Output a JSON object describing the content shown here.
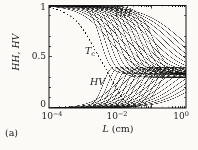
{
  "panel_label": "(a)",
  "axes": {
    "y": {
      "label": "HH, HV",
      "ticks": [
        "1",
        "0.5",
        "0"
      ]
    },
    "x": {
      "label_var": "L",
      "label_unit": " (cm)",
      "ticks": [
        {
          "base": "10",
          "exp": "−4"
        },
        {
          "base": "10",
          "exp": "−2"
        },
        {
          "base": "10",
          "exp": "0"
        }
      ]
    }
  },
  "annotations": {
    "hh": "HH",
    "hv": "HV",
    "tc_main": "T",
    "tc_sub": "c"
  },
  "chart_data": {
    "type": "line",
    "title": "",
    "xlabel": "L (cm)",
    "ylabel": "HH, HV",
    "x_axis": {
      "scale": "log10",
      "range_log10": [
        -4,
        0
      ],
      "tick_labels": [
        "10^-4",
        "10^-2",
        "10^0"
      ],
      "minor_ticks": true
    },
    "y_axis": {
      "range": [
        0,
        1
      ],
      "major_ticks": [
        0,
        0.5,
        1
      ],
      "minor_tick_step": 0.1
    },
    "frame_px": {
      "left": 49,
      "top": 5.5,
      "right": 186,
      "bottom": 108
    },
    "ink": "#131313",
    "curve_alpha": 0.8,
    "families": {
      "hh": {
        "label": "HH",
        "start_value": 1,
        "asymptote": 0.33,
        "model": "HH(x) = A + (1-A)/(1+exp((x-t)/w)), x = log10(L in cm)",
        "subfamilies": [
          {
            "count": 13,
            "t_range": [
              -2.5,
              -0.95
            ],
            "w_range": [
              0.15,
              0.22
            ]
          },
          {
            "count": 13,
            "t_range": [
              -2.25,
              -0.12
            ],
            "w_range": [
              0.42,
              0.58
            ]
          }
        ]
      },
      "hv": {
        "label": "HV",
        "start_value": 0,
        "settle_value": 0.3,
        "peak_param": 0.52,
        "release": 3.0,
        "model": "HV(x) = P*s(u) - (P-E)*s(u-g), u = (x-s0)/v, s(z)=1/(1+exp(-z))",
        "subfamilies": [
          {
            "count": 13,
            "s_range": [
              -2.4,
              -0.75
            ],
            "v_range": [
              0.14,
              0.2
            ]
          },
          {
            "count": 13,
            "s_range": [
              -2.0,
              0.45
            ],
            "v_range": [
              0.38,
              0.55
            ]
          }
        ]
      }
    },
    "tc_curve": {
      "label": "T_c",
      "style": "dashed",
      "points": [
        [
          -4,
          0.985
        ],
        [
          -3.7,
          0.955
        ],
        [
          -3.4,
          0.905
        ],
        [
          -3.15,
          0.835
        ],
        [
          -2.95,
          0.74
        ],
        [
          -2.8,
          0.655
        ],
        [
          -2.66,
          0.57
        ],
        [
          -2.5,
          0.475
        ],
        [
          -2.37,
          0.4
        ],
        [
          -2.25,
          0.325
        ],
        [
          -2.13,
          0.25
        ],
        [
          -2.0,
          0.175
        ],
        [
          -1.9,
          0.12
        ],
        [
          -1.8,
          0.07
        ],
        [
          -1.68,
          0.035
        ],
        [
          -1.55,
          0.012
        ],
        [
          -1.4,
          0.004
        ]
      ]
    }
  }
}
